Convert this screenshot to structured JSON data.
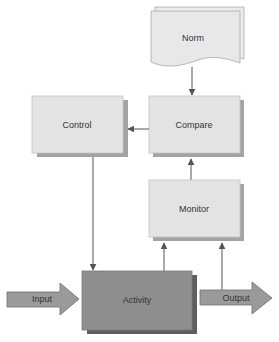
{
  "diagram": {
    "nodes": {
      "norm": {
        "label": "Norm",
        "shape": "document-stack"
      },
      "compare": {
        "label": "Compare",
        "shape": "box"
      },
      "control": {
        "label": "Control",
        "shape": "box"
      },
      "monitor": {
        "label": "Monitor",
        "shape": "box"
      },
      "activity": {
        "label": "Activity",
        "shape": "box-dark"
      }
    },
    "flows": {
      "input": {
        "label": "Input"
      },
      "output": {
        "label": "Output"
      }
    },
    "edges": [
      {
        "from": "norm",
        "to": "compare"
      },
      {
        "from": "compare",
        "to": "control"
      },
      {
        "from": "control",
        "to": "activity"
      },
      {
        "from": "activity",
        "to": "monitor"
      },
      {
        "from": "output",
        "to": "monitor"
      },
      {
        "from": "monitor",
        "to": "compare"
      }
    ],
    "colors": {
      "box_fill": "#e3e3e3",
      "box_stroke": "#c4c4c4",
      "shadow": "#a3a3a3",
      "activity_fill": "#8e8e8e",
      "activity_shadow": "#5e5e5e",
      "arrow_fill": "#9a9a9a",
      "line": "#555555"
    }
  }
}
